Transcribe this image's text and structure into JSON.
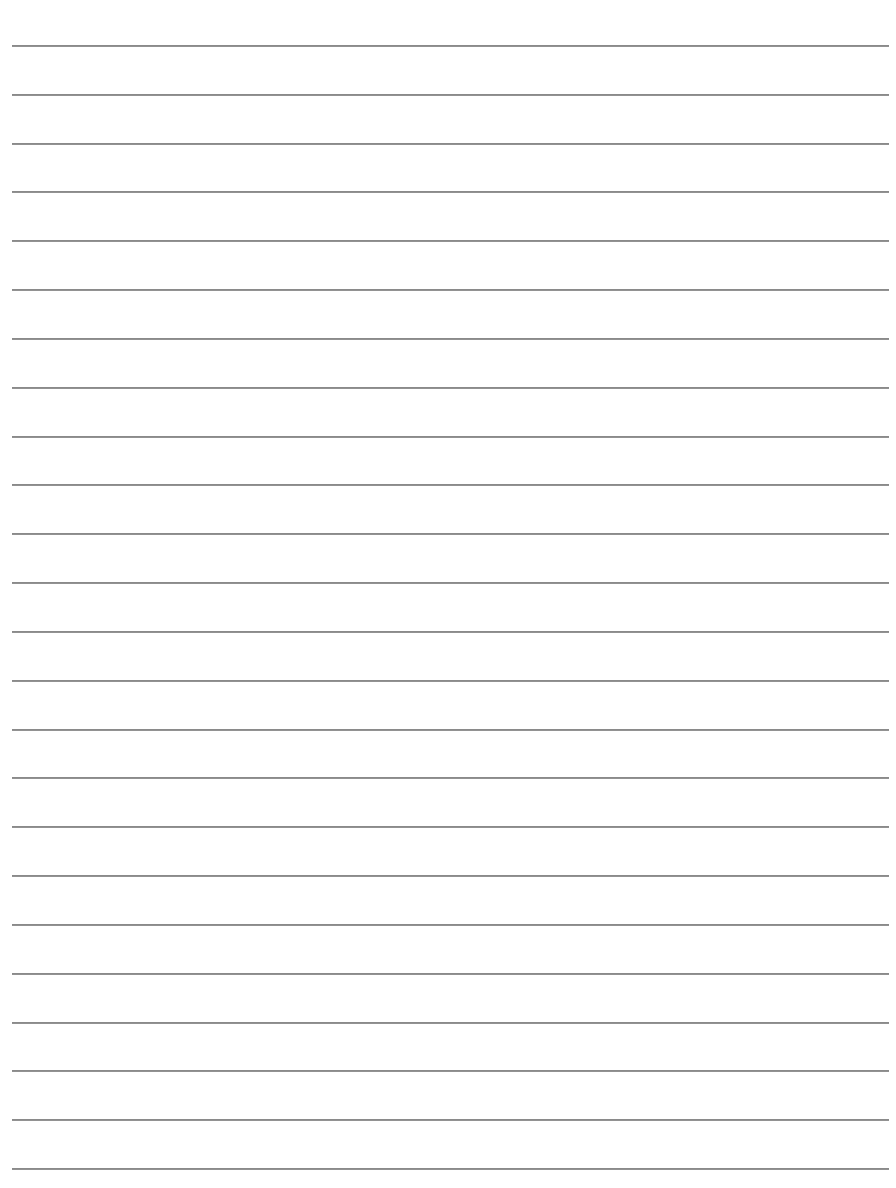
{
  "page": {
    "type": "lined-paper",
    "background_color": "#ffffff",
    "rule_color": "#8a8a8a",
    "rule_count": 24,
    "first_rule_y": 45,
    "rule_spacing": 48.83,
    "rule_left": 12,
    "rule_right": 889,
    "text": []
  }
}
